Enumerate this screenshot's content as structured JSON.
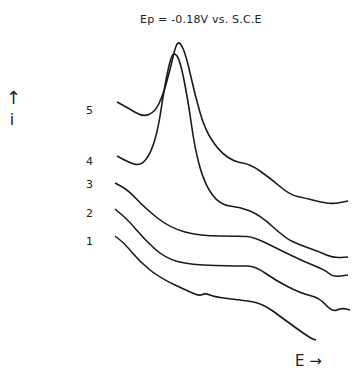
{
  "chart_data": {
    "type": "line",
    "title": "Ep = -0.18V vs. S.C.E",
    "xlabel": "E →",
    "ylabel": "↑ i",
    "grid": false,
    "legend": "curve numbers at left",
    "series": [
      {
        "name": "1",
        "label_pos": [
          88,
          240
        ],
        "points": [
          [
            115,
            236
          ],
          [
            125,
            244
          ],
          [
            140,
            262
          ],
          [
            160,
            278
          ],
          [
            190,
            292
          ],
          [
            200,
            296
          ],
          [
            205,
            293
          ],
          [
            215,
            297
          ],
          [
            240,
            300
          ],
          [
            262,
            303
          ],
          [
            285,
            320
          ],
          [
            310,
            338
          ],
          [
            316,
            340
          ]
        ]
      },
      {
        "name": "2",
        "label_pos": [
          88,
          213
        ],
        "points": [
          [
            115,
            209
          ],
          [
            128,
            220
          ],
          [
            145,
            240
          ],
          [
            165,
            258
          ],
          [
            190,
            265
          ],
          [
            240,
            266
          ],
          [
            255,
            266
          ],
          [
            275,
            280
          ],
          [
            300,
            293
          ],
          [
            320,
            298
          ],
          [
            332,
            312
          ],
          [
            342,
            308
          ],
          [
            350,
            310
          ]
        ]
      },
      {
        "name": "3",
        "label_pos": [
          88,
          186
        ],
        "points": [
          [
            115,
            183
          ],
          [
            128,
            190
          ],
          [
            145,
            208
          ],
          [
            170,
            228
          ],
          [
            200,
            236
          ],
          [
            240,
            236
          ],
          [
            254,
            237
          ],
          [
            280,
            250
          ],
          [
            305,
            262
          ],
          [
            325,
            270
          ],
          [
            333,
            277
          ],
          [
            348,
            275
          ]
        ]
      },
      {
        "name": "4",
        "label_pos": [
          88,
          159
        ],
        "points": [
          [
            117,
            156
          ],
          [
            128,
            162
          ],
          [
            140,
            166
          ],
          [
            150,
            155
          ],
          [
            158,
            130
          ],
          [
            164,
            90
          ],
          [
            170,
            60
          ],
          [
            174,
            52
          ],
          [
            180,
            60
          ],
          [
            188,
            100
          ],
          [
            195,
            150
          ],
          [
            205,
            185
          ],
          [
            220,
            205
          ],
          [
            240,
            207
          ],
          [
            260,
            215
          ],
          [
            285,
            238
          ],
          [
            300,
            245
          ],
          [
            320,
            252
          ],
          [
            333,
            258
          ],
          [
            348,
            257
          ]
        ]
      },
      {
        "name": "5",
        "label_pos": [
          88,
          105
        ],
        "points": [
          [
            117,
            102
          ],
          [
            128,
            108
          ],
          [
            143,
            117
          ],
          [
            155,
            112
          ],
          [
            163,
            95
          ],
          [
            170,
            70
          ],
          [
            176,
            44
          ],
          [
            180,
            42
          ],
          [
            186,
            55
          ],
          [
            195,
            95
          ],
          [
            205,
            130
          ],
          [
            220,
            152
          ],
          [
            235,
            162
          ],
          [
            250,
            164
          ],
          [
            270,
            178
          ],
          [
            290,
            195
          ],
          [
            305,
            198
          ],
          [
            320,
            202
          ],
          [
            333,
            204
          ],
          [
            348,
            201
          ]
        ]
      }
    ],
    "annotations": [
      "Ep = -0.18V vs. S.C.E"
    ]
  }
}
